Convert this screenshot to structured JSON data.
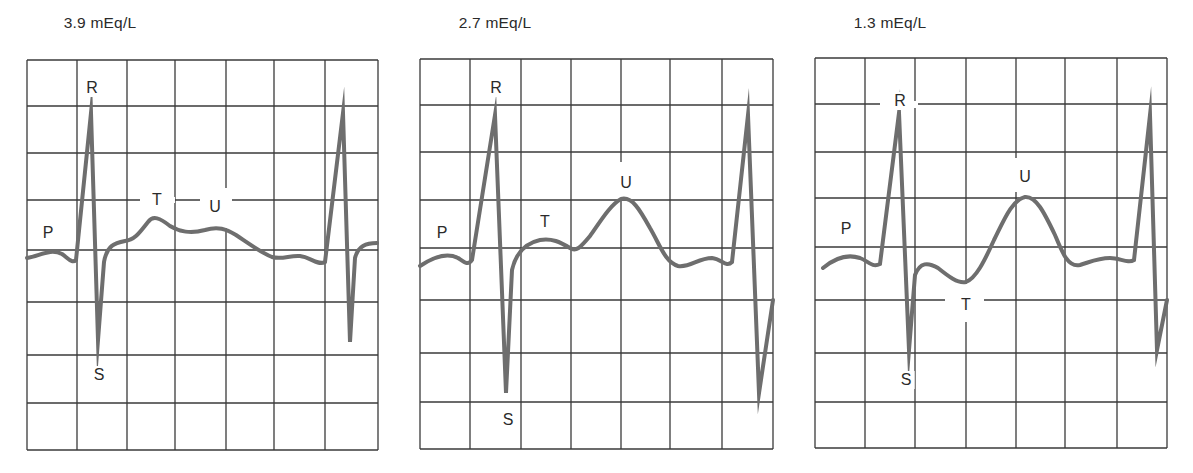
{
  "figure": {
    "colors": {
      "grid": "#3a3a3a",
      "trace": "#6e6e6e",
      "text": "#2a2a2a",
      "background": "#ffffff"
    }
  },
  "panels": [
    {
      "title": "3.9 mEq/L",
      "title_x": 100,
      "grid": {
        "x": [
          27,
          77,
          127,
          175,
          226,
          274,
          325,
          378
        ],
        "y": [
          60,
          106,
          153,
          200,
          250,
          302,
          355,
          403,
          450
        ]
      },
      "labels": [
        {
          "text": "P",
          "x": 48,
          "y": 233
        },
        {
          "text": "R",
          "x": 92,
          "y": 88
        },
        {
          "text": "T",
          "x": 157,
          "y": 200
        },
        {
          "text": "U",
          "x": 215,
          "y": 207
        },
        {
          "text": "S",
          "x": 99,
          "y": 375
        }
      ],
      "gaps": [
        {
          "x1": 140,
          "y1": 197,
          "x2": 175,
          "y2": 203
        },
        {
          "x1": 200,
          "y1": 197,
          "x2": 232,
          "y2": 203
        },
        {
          "x1": 223,
          "y1": 188,
          "x2": 229,
          "y2": 228
        }
      ],
      "trace": "M27,258 C40,256 50,248 62,254 C68,258 72,264 76,260 L91,113 L98,340 L104,262 C107,245 115,243 125,241 C135,240 140,232 148,222 C153,215 160,218 170,226 C180,232 190,234 205,230 C218,226 226,229 236,235 C248,243 260,252 272,257 C282,260 290,255 300,256 C310,257 318,266 325,262 L343,113 L350,342 L355,258 C358,246 366,243 377,243"
    },
    {
      "title": "2.7 mEq/L",
      "title_x": 495,
      "grid": {
        "x": [
          420,
          470,
          521,
          571,
          621,
          670,
          722,
          773
        ],
        "y": [
          59,
          105,
          152,
          200,
          248,
          300,
          353,
          402,
          449
        ]
      },
      "labels": [
        {
          "text": "P",
          "x": 442,
          "y": 233
        },
        {
          "text": "R",
          "x": 496,
          "y": 88
        },
        {
          "text": "T",
          "x": 545,
          "y": 222
        },
        {
          "text": "U",
          "x": 626,
          "y": 183
        },
        {
          "text": "S",
          "x": 508,
          "y": 420
        }
      ],
      "gaps": [
        {
          "x1": 618,
          "y1": 162,
          "x2": 624,
          "y2": 198
        }
      ],
      "trace": "M420,266 C432,258 446,252 458,258 C464,262 468,266 472,260 L495,115 L506,393 L512,270 C516,252 526,243 540,240 C552,238 560,242 570,248 C576,252 580,248 590,236 C600,222 610,205 621,199 C632,196 640,210 650,228 C660,245 665,262 678,266 C690,268 698,258 712,258 C722,259 726,268 732,262 L748,115 L759,393 L773,300"
    },
    {
      "title": "1.3 mEq/L",
      "title_x": 890,
      "grid": {
        "x": [
          815,
          865,
          915,
          966,
          1016,
          1065,
          1117,
          1167
        ],
        "y": [
          58,
          104,
          152,
          198,
          247,
          300,
          353,
          402,
          448
        ]
      },
      "labels": [
        {
          "text": "P",
          "x": 846,
          "y": 229
        },
        {
          "text": "R",
          "x": 900,
          "y": 101
        },
        {
          "text": "T",
          "x": 966,
          "y": 305
        },
        {
          "text": "U",
          "x": 1025,
          "y": 177
        },
        {
          "text": "S",
          "x": 906,
          "y": 380
        }
      ],
      "gaps": [
        {
          "x1": 880,
          "y1": 101,
          "x2": 918,
          "y2": 108
        },
        {
          "x1": 945,
          "y1": 295,
          "x2": 984,
          "y2": 303
        },
        {
          "x1": 963,
          "y1": 284,
          "x2": 969,
          "y2": 322
        },
        {
          "x1": 1013,
          "y1": 158,
          "x2": 1019,
          "y2": 192
        }
      ],
      "trace": "M823,268 C835,258 848,254 860,258 C868,261 872,268 880,264 L899,113 L909,350 L915,275 C920,262 928,262 938,268 C948,276 958,284 966,282 C976,278 984,262 994,240 C1004,220 1012,200 1025,197 C1036,196 1044,212 1055,235 C1062,252 1068,268 1080,265 C1090,262 1098,258 1110,258 C1120,258 1128,264 1134,260 L1150,115 L1157,350 L1167,300"
    }
  ]
}
